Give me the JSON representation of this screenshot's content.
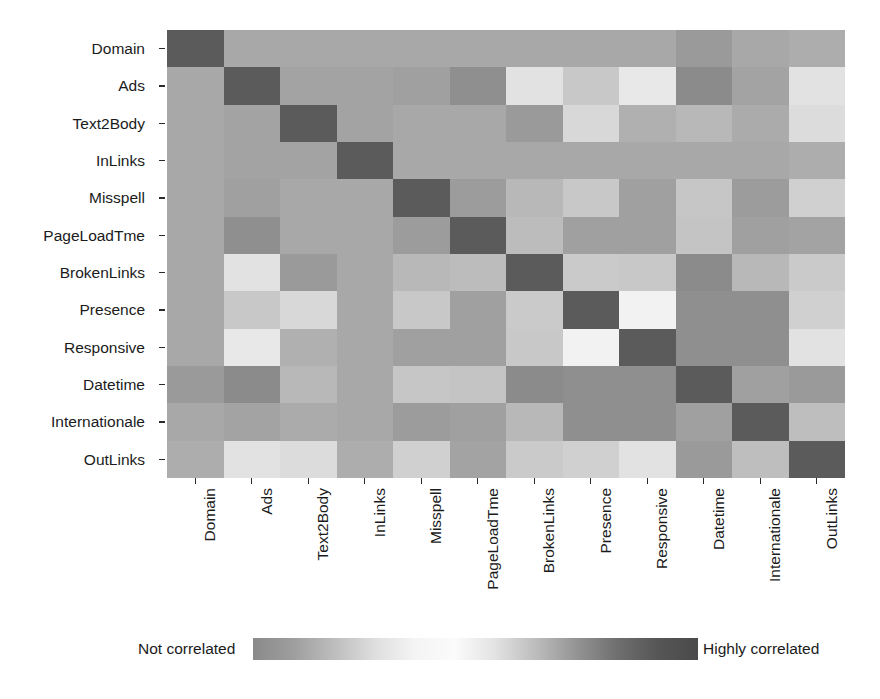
{
  "chart_data": {
    "type": "heatmap",
    "title": "",
    "xlabel": "",
    "ylabel": "",
    "grid": false,
    "legend_position": "bottom",
    "categories": [
      "Domain",
      "Ads",
      "Text2Body",
      "InLinks",
      "Misspell",
      "PageLoadTme",
      "BrokenLinks",
      "Presence",
      "Responsive",
      "Datetime",
      "Internationale",
      "OutLinks"
    ],
    "x_tick_labels": [
      "Domain",
      "Ads",
      "Text2Body",
      "InLinks",
      "Misspell",
      "PageLoadTme",
      "BrokenLinks",
      "Presence",
      "Responsive",
      "Datetime",
      "Internationale",
      "OutLinks"
    ],
    "y_tick_labels": [
      "Domain",
      "Ads",
      "Text2Body",
      "InLinks",
      "Misspell",
      "PageLoadTme",
      "BrokenLinks",
      "Presence",
      "Responsive",
      "Datetime",
      "Internationale",
      "OutLinks"
    ],
    "value_range": [
      0,
      1
    ],
    "colorscale_description": "grayscale: mid-gray = not correlated, near-white = intermediate, dark gray = highly correlated",
    "colorbar": {
      "left_label": "Not correlated",
      "right_label": "Highly correlated",
      "stops": [
        "#8a8a8a",
        "#9e9e9e",
        "#bdbdbd",
        "#dedede",
        "#f4f4f4",
        "#fbfbfb",
        "#e2e2e2",
        "#bcbcbc",
        "#949494",
        "#6f6f6f",
        "#565656",
        "#4a4a4a"
      ]
    },
    "matrix": [
      [
        1.0,
        0.38,
        0.38,
        0.38,
        0.38,
        0.38,
        0.38,
        0.38,
        0.38,
        0.45,
        0.38,
        0.36
      ],
      [
        0.38,
        1.0,
        0.4,
        0.4,
        0.42,
        0.5,
        0.12,
        0.22,
        0.1,
        0.52,
        0.4,
        0.12
      ],
      [
        0.38,
        0.4,
        1.0,
        0.4,
        0.38,
        0.38,
        0.46,
        0.16,
        0.34,
        0.3,
        0.36,
        0.14
      ],
      [
        0.38,
        0.4,
        0.4,
        1.0,
        0.38,
        0.38,
        0.38,
        0.38,
        0.38,
        0.38,
        0.38,
        0.36
      ],
      [
        0.38,
        0.42,
        0.38,
        0.38,
        1.0,
        0.44,
        0.3,
        0.22,
        0.42,
        0.2,
        0.44,
        0.18
      ],
      [
        0.38,
        0.5,
        0.38,
        0.38,
        0.44,
        1.0,
        0.28,
        0.42,
        0.42,
        0.22,
        0.42,
        0.4
      ],
      [
        0.38,
        0.12,
        0.46,
        0.38,
        0.3,
        0.28,
        1.0,
        0.2,
        0.22,
        0.52,
        0.3,
        0.2
      ],
      [
        0.38,
        0.22,
        0.16,
        0.38,
        0.22,
        0.42,
        0.2,
        1.0,
        0.06,
        0.5,
        0.5,
        0.18
      ],
      [
        0.38,
        0.1,
        0.34,
        0.38,
        0.42,
        0.42,
        0.22,
        0.06,
        1.0,
        0.5,
        0.5,
        0.12
      ],
      [
        0.45,
        0.52,
        0.3,
        0.38,
        0.2,
        0.22,
        0.52,
        0.5,
        0.5,
        1.0,
        0.42,
        0.46
      ],
      [
        0.38,
        0.4,
        0.36,
        0.38,
        0.44,
        0.42,
        0.3,
        0.5,
        0.5,
        0.42,
        1.0,
        0.26
      ],
      [
        0.36,
        0.12,
        0.14,
        0.36,
        0.18,
        0.4,
        0.2,
        0.18,
        0.12,
        0.46,
        0.26,
        1.0
      ]
    ],
    "cell_colors": [
      [
        "#5b5b5b",
        "#a8a8a8",
        "#a8a8a8",
        "#a8a8a8",
        "#a8a8a8",
        "#a8a8a8",
        "#a8a8a8",
        "#a8a8a8",
        "#a8a8a8",
        "#9a9a9a",
        "#a8a8a8",
        "#adadad"
      ],
      [
        "#a8a8a8",
        "#5b5b5b",
        "#a3a3a3",
        "#a3a3a3",
        "#a0a0a0",
        "#8f8f8f",
        "#e2e2e2",
        "#c8c8c8",
        "#e8e8e8",
        "#8b8b8b",
        "#a3a3a3",
        "#e2e2e2"
      ],
      [
        "#a8a8a8",
        "#a3a3a3",
        "#5b5b5b",
        "#a3a3a3",
        "#a8a8a8",
        "#a8a8a8",
        "#9a9a9a",
        "#d8d8d8",
        "#b0b0b0",
        "#b8b8b8",
        "#ababab",
        "#dcdcdc"
      ],
      [
        "#a8a8a8",
        "#a3a3a3",
        "#a3a3a3",
        "#5b5b5b",
        "#a8a8a8",
        "#a8a8a8",
        "#a8a8a8",
        "#a8a8a8",
        "#a8a8a8",
        "#a8a8a8",
        "#a8a8a8",
        "#adadad"
      ],
      [
        "#a8a8a8",
        "#a0a0a0",
        "#a8a8a8",
        "#a8a8a8",
        "#5b5b5b",
        "#9c9c9c",
        "#b8b8b8",
        "#c8c8c8",
        "#a0a0a0",
        "#c6c6c6",
        "#9c9c9c",
        "#d0d0d0"
      ],
      [
        "#a8a8a8",
        "#8f8f8f",
        "#a8a8a8",
        "#a8a8a8",
        "#9c9c9c",
        "#5b5b5b",
        "#bcbcbc",
        "#a0a0a0",
        "#a0a0a0",
        "#c4c4c4",
        "#a0a0a0",
        "#a3a3a3"
      ],
      [
        "#a8a8a8",
        "#e2e2e2",
        "#9a9a9a",
        "#a8a8a8",
        "#b8b8b8",
        "#bcbcbc",
        "#5b5b5b",
        "#cacaca",
        "#c8c8c8",
        "#8b8b8b",
        "#b8b8b8",
        "#cacaca"
      ],
      [
        "#a8a8a8",
        "#c8c8c8",
        "#d8d8d8",
        "#a8a8a8",
        "#c8c8c8",
        "#a0a0a0",
        "#cacaca",
        "#5b5b5b",
        "#f2f2f2",
        "#8f8f8f",
        "#8f8f8f",
        "#d0d0d0"
      ],
      [
        "#a8a8a8",
        "#e8e8e8",
        "#b0b0b0",
        "#a8a8a8",
        "#a0a0a0",
        "#a0a0a0",
        "#c8c8c8",
        "#f2f2f2",
        "#5b5b5b",
        "#8f8f8f",
        "#8f8f8f",
        "#e2e2e2"
      ],
      [
        "#9a9a9a",
        "#8b8b8b",
        "#b8b8b8",
        "#a8a8a8",
        "#c6c6c6",
        "#c4c4c4",
        "#8b8b8b",
        "#8f8f8f",
        "#8f8f8f",
        "#5b5b5b",
        "#a0a0a0",
        "#9a9a9a"
      ],
      [
        "#a8a8a8",
        "#a3a3a3",
        "#ababab",
        "#a8a8a8",
        "#9c9c9c",
        "#a0a0a0",
        "#b8b8b8",
        "#8f8f8f",
        "#8f8f8f",
        "#a0a0a0",
        "#5b5b5b",
        "#bebebe"
      ],
      [
        "#adadad",
        "#e2e2e2",
        "#dcdcdc",
        "#adadad",
        "#d0d0d0",
        "#a3a3a3",
        "#cacaca",
        "#d0d0d0",
        "#e2e2e2",
        "#9a9a9a",
        "#bebebe",
        "#5b5b5b"
      ]
    ]
  }
}
